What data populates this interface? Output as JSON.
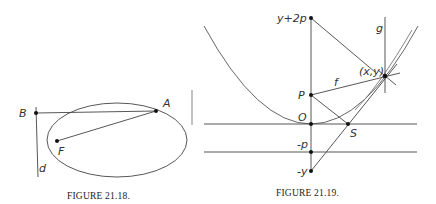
{
  "figure_left": {
    "caption": "FIGURE 21.18.",
    "labels": {
      "B": "B",
      "A": "A",
      "F": "F",
      "d": "d"
    },
    "points": {
      "B": [
        36,
        113
      ],
      "A": [
        156,
        111
      ],
      "F": [
        57,
        141
      ]
    },
    "ellipse": {
      "cx": 117,
      "cy": 140,
      "rx": 70,
      "ry": 37
    }
  },
  "figure_right": {
    "caption": "FIGURE 21.19.",
    "labels": {
      "y2p": "y+2p",
      "g": "g",
      "xy": "(x,y)",
      "f": "f",
      "P": "P",
      "O": "O",
      "S": "S",
      "neg_p": "-p",
      "neg_y": "-y"
    },
    "points": {
      "y2p": [
        311,
        18
      ],
      "P": [
        311,
        95
      ],
      "O": [
        311,
        124
      ],
      "S": [
        348,
        124
      ],
      "neg_p": [
        311,
        152
      ],
      "neg_y": [
        311,
        171
      ],
      "xy": [
        385,
        76
      ]
    }
  }
}
